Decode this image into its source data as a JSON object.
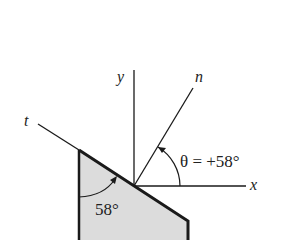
{
  "diagram": {
    "axes": {
      "x_label": "x",
      "y_label": "y",
      "n_label": "n",
      "t_label": "t"
    },
    "theta_annotation": "θ = +58°",
    "inner_angle_label": "58°",
    "theta_degrees": 58,
    "colors": {
      "line": "#1a1a1a",
      "block_fill": "#d9d9d9",
      "background": "#ffffff"
    }
  }
}
